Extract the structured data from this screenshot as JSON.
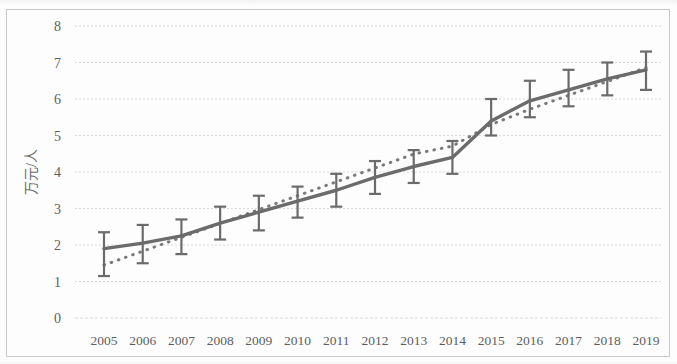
{
  "chart_data": {
    "type": "line",
    "title": "",
    "xlabel": "",
    "ylabel": "万元/人",
    "ylim": [
      0,
      8
    ],
    "yticks": [
      0,
      1,
      2,
      3,
      4,
      5,
      6,
      7,
      8
    ],
    "grid": true,
    "legend": "none",
    "categories": [
      "2005",
      "2006",
      "2007",
      "2008",
      "2009",
      "2010",
      "2011",
      "2012",
      "2013",
      "2014",
      "2015",
      "2016",
      "2017",
      "2018",
      "2019"
    ],
    "series": [
      {
        "name": "观测值",
        "style": "solid-line-with-error-bars",
        "color": "#6b6b6b",
        "values": [
          1.9,
          2.05,
          2.25,
          2.6,
          2.9,
          3.2,
          3.5,
          3.85,
          4.15,
          4.4,
          5.4,
          5.95,
          6.25,
          6.55,
          6.8
        ],
        "error_upper": [
          2.35,
          2.55,
          2.7,
          3.05,
          3.35,
          3.6,
          3.95,
          4.3,
          4.6,
          4.85,
          6.0,
          6.5,
          6.8,
          7.0,
          7.3
        ],
        "error_lower": [
          1.15,
          1.5,
          1.75,
          2.15,
          2.4,
          2.75,
          3.05,
          3.4,
          3.7,
          3.95,
          5.0,
          5.5,
          5.8,
          6.1,
          6.25
        ]
      },
      {
        "name": "趋势线",
        "style": "dotted-trend-line",
        "color": "#7a7a7a",
        "values": [
          1.45,
          1.83,
          2.21,
          2.59,
          2.97,
          3.35,
          3.73,
          4.11,
          4.49,
          4.71,
          5.3,
          5.72,
          6.1,
          6.48,
          6.86
        ]
      }
    ]
  },
  "axes": {
    "y_axis_label": "万元/人",
    "y_tick_labels": [
      "8",
      "7",
      "6",
      "5",
      "4",
      "3",
      "2",
      "1",
      "0"
    ],
    "x_tick_labels": [
      "2005",
      "2006",
      "2007",
      "2008",
      "2009",
      "2010",
      "2011",
      "2012",
      "2013",
      "2014",
      "2015",
      "2016",
      "2017",
      "2018",
      "2019"
    ]
  },
  "colors": {
    "line": "#6b6b6b",
    "trend": "#7a7a7a",
    "grid": "#d8d8d8",
    "text": "#5d5d5d",
    "border": "#c9c9c9",
    "background": "#fdfdfd"
  }
}
